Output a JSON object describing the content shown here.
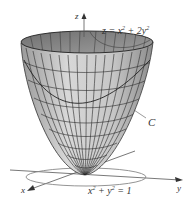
{
  "figure": {
    "axes": {
      "x_label": "x",
      "y_label": "y",
      "z_label": "z"
    },
    "surface": {
      "equation_lhs": "z = x",
      "equation_mid": " + 2y",
      "exp": "2",
      "description": "elliptic paraboloid z = x^2 + 2y^2"
    },
    "curve_label": "C",
    "circle": {
      "part1": "x",
      "part2": " + y",
      "part3": " = 1",
      "exp": "2",
      "description": "x^2 + y^2 = 1"
    },
    "colors": {
      "surface_outer": "#c9c9c9",
      "surface_inner": "#8a8a8a",
      "mesh": "#2a2a2a",
      "axis": "#444444",
      "circle": "#888888"
    }
  }
}
